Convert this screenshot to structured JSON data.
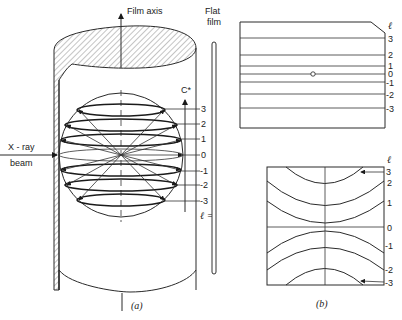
{
  "panel_a": {
    "caption": "(a)",
    "film_axis_label": "Film axis",
    "flat_film_label_line1": "Flat",
    "flat_film_label_line2": "film",
    "xray_label_line1": "X - ray",
    "xray_label_line2": "beam",
    "c_star_label": "C*",
    "layer_labels": [
      "3",
      "2",
      "1",
      "0",
      "-1",
      "-2",
      "-3"
    ],
    "l_equals_label": "ℓ ="
  },
  "panel_b": {
    "caption": "(b)",
    "top": {
      "l_header": "ℓ",
      "layer_labels": [
        "3",
        "2",
        "1",
        "0",
        "-1",
        "-2",
        "-3"
      ],
      "center_label": "c"
    },
    "bottom": {
      "l_header": "ℓ",
      "layer_labels": [
        "3",
        "2",
        "1",
        "0",
        "-1",
        "-2",
        "-3"
      ]
    }
  }
}
